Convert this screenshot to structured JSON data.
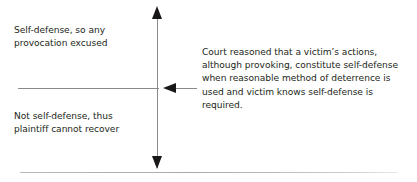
{
  "diagram": {
    "background_color": "#ffffff",
    "text_color": "#231f20",
    "line_color": "#8a8a8d",
    "arrow_color": "#1a1718",
    "rule_color": "#b9b9bd",
    "labels": {
      "upper_left": "Self-defense, so any\nprovocation excused",
      "lower_left": "Not self-defense, thus\nplaintiff cannot recover",
      "annotation_right": "Court reasoned that a victim’s actions, although provoking, constitute self-defense when reasonable method of deterrence is used and victim knows self-defense is required."
    },
    "icons": {
      "axis_arrow_up": "arrow-up-icon",
      "axis_arrow_down": "arrow-down-icon",
      "connector_arrow_left": "arrow-left-icon"
    }
  }
}
